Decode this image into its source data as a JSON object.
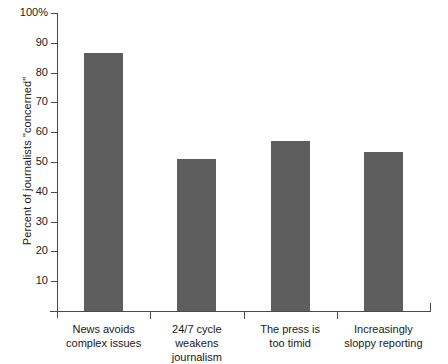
{
  "chart_data": {
    "type": "bar",
    "title": "",
    "xlabel": "",
    "ylabel": "Percent of journalists \"concerned\"",
    "ylim": [
      0,
      100
    ],
    "ytick_values": [
      10,
      20,
      30,
      40,
      50,
      60,
      70,
      80,
      90,
      100
    ],
    "ytick_labels": [
      "10",
      "20",
      "30",
      "40",
      "50",
      "60",
      "70",
      "80",
      "90",
      "100%"
    ],
    "grid": false,
    "legend": false,
    "bar_color": "#5e5e5e",
    "axis_color": "#4a4a4a",
    "categories": [
      "News avoids\ncomplex issues",
      "24/7 cycle weakens\njournalism",
      "The press is\ntoo timid",
      "Increasingly\nsloppy reporting"
    ],
    "values": [
      86.5,
      51,
      57,
      53.5
    ]
  }
}
